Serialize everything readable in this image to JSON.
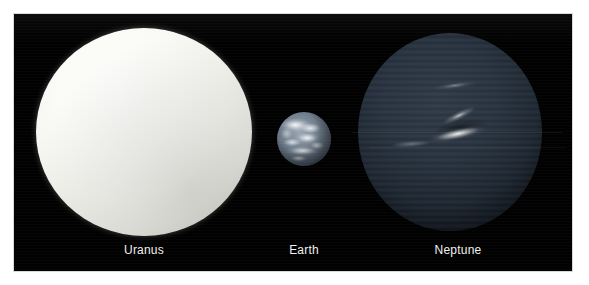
{
  "figure": {
    "background_color": "#ffffff",
    "panel_background_color": "#010101",
    "label_color": "#f0f0f0"
  },
  "objects": [
    {
      "id": "uranus",
      "label": "Uranus",
      "appearance": "pale, featureless, uniformly bright cyan-white disc",
      "dominant_color": "#f4f4ef"
    },
    {
      "id": "earth",
      "label": "Earth",
      "appearance": "small blue-grey disc with bright white cloud patterns",
      "dominant_color": "#6f7d8c"
    },
    {
      "id": "neptune",
      "label": "Neptune",
      "appearance": "dark blue disc with a bright elongated cloud streak near the equator",
      "dominant_color": "#28333f"
    }
  ],
  "labels": {
    "uranus": "Uranus",
    "earth": "Earth",
    "neptune": "Neptune"
  }
}
